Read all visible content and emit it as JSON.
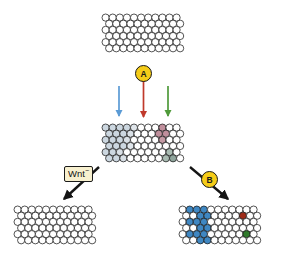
{
  "figure": {
    "background_color": "#ffffff"
  },
  "palette": {
    "cell_outline": "#1a1a1a",
    "cell_white": "#ffffff",
    "pale_blue": "#ccd7e0",
    "pale_blue_alt": "#d8e0e6",
    "pale_red": "#c89aa4",
    "pale_green": "#a9bbb2",
    "strong_blue": "#3f87c2",
    "dark_red": "#9e2b18",
    "dark_green": "#2f7a2b",
    "badge_yellow": "#f5cc18",
    "label_cream": "#f7f0cf",
    "arrow_blue": "#5b9bd5",
    "arrow_red": "#c0392b",
    "arrow_green": "#4f9a3a",
    "arrow_black": "#151515"
  },
  "nodes": {
    "a_badge": {
      "label": "A",
      "name": "signal-a"
    },
    "b_badge": {
      "label": "B",
      "name": "signal-b"
    }
  },
  "labels": {
    "wnt": {
      "text": "Wnt",
      "superscript": "−"
    }
  },
  "arrows": [
    {
      "name": "blue-down-arrow",
      "color": "#5b9bd5",
      "x1": 119,
      "y1": 86,
      "x2": 119,
      "y2": 116
    },
    {
      "name": "red-down-arrow",
      "color": "#c0392b",
      "x1": 143.5,
      "y1": 72,
      "x2": 143.5,
      "y2": 117
    },
    {
      "name": "green-down-arrow",
      "color": "#4f9a3a",
      "x1": 168,
      "y1": 86,
      "x2": 168,
      "y2": 116
    },
    {
      "name": "wnt-diagonal-arrow",
      "color": "#151515",
      "x1": 99,
      "y1": 167,
      "x2": 64,
      "y2": 199
    },
    {
      "name": "b-diagonal-arrow",
      "color": "#151515",
      "x1": 190,
      "y1": 167,
      "x2": 228,
      "y2": 199
    }
  ],
  "sheets": {
    "top": {
      "name": "undifferentiated-sheet",
      "x": 101,
      "y": 13,
      "cols": 11,
      "rows": 6,
      "radius": 3.6,
      "step": 7.1,
      "cells": []
    },
    "middle": {
      "name": "patterned-sheet",
      "x": 101,
      "y": 123,
      "cols": 11,
      "rows": 6,
      "radius": 3.6,
      "step": 7.1,
      "cells": [
        {
          "r": 0,
          "c": 0,
          "fill": "#ccd7e0"
        },
        {
          "r": 0,
          "c": 1,
          "fill": "#ccd7e0"
        },
        {
          "r": 0,
          "c": 2,
          "fill": "#ccd7e0"
        },
        {
          "r": 0,
          "c": 3,
          "fill": "#ccd7e0"
        },
        {
          "r": 0,
          "c": 4,
          "fill": "#dfe5ea"
        },
        {
          "r": 0,
          "c": 8,
          "fill": "#c08f9c"
        },
        {
          "r": 1,
          "c": 0,
          "fill": "#ccd7e0"
        },
        {
          "r": 1,
          "c": 1,
          "fill": "#ccd7e0"
        },
        {
          "r": 1,
          "c": 2,
          "fill": "#ccd7e0"
        },
        {
          "r": 1,
          "c": 3,
          "fill": "#d9e0e6"
        },
        {
          "r": 1,
          "c": 7,
          "fill": "#c08f9c"
        },
        {
          "r": 1,
          "c": 8,
          "fill": "#c08f9c"
        },
        {
          "r": 2,
          "c": 0,
          "fill": "#ccd7e0"
        },
        {
          "r": 2,
          "c": 1,
          "fill": "#ccd7e0"
        },
        {
          "r": 2,
          "c": 2,
          "fill": "#ccd7e0"
        },
        {
          "r": 2,
          "c": 3,
          "fill": "#d9e0e6"
        },
        {
          "r": 2,
          "c": 8,
          "fill": "#c49aa4"
        },
        {
          "r": 3,
          "c": 0,
          "fill": "#ccd7e0"
        },
        {
          "r": 3,
          "c": 1,
          "fill": "#ccd7e0"
        },
        {
          "r": 3,
          "c": 2,
          "fill": "#ccd7e0"
        },
        {
          "r": 3,
          "c": 3,
          "fill": "#dfe5ea"
        },
        {
          "r": 4,
          "c": 0,
          "fill": "#ccd7e0"
        },
        {
          "r": 4,
          "c": 1,
          "fill": "#ccd7e0"
        },
        {
          "r": 4,
          "c": 2,
          "fill": "#d9e0e6"
        },
        {
          "r": 4,
          "c": 9,
          "fill": "#a9bbb2"
        },
        {
          "r": 5,
          "c": 0,
          "fill": "#ccd7e0"
        },
        {
          "r": 5,
          "c": 1,
          "fill": "#ccd7e0"
        },
        {
          "r": 5,
          "c": 2,
          "fill": "#d9e0e6"
        },
        {
          "r": 5,
          "c": 8,
          "fill": "#a9bbb2"
        },
        {
          "r": 5,
          "c": 9,
          "fill": "#8fa59c"
        }
      ]
    },
    "bottom_left": {
      "name": "wnt-minus-sheet",
      "x": 13,
      "y": 205,
      "cols": 11,
      "rows": 6,
      "radius": 3.6,
      "step": 7.1,
      "cells": []
    },
    "bottom_right": {
      "name": "differentiated-sheet",
      "x": 178,
      "y": 205,
      "cols": 11,
      "rows": 6,
      "radius": 3.6,
      "step": 7.1,
      "cells": [
        {
          "r": 0,
          "c": 1,
          "fill": "#3f87c2"
        },
        {
          "r": 0,
          "c": 2,
          "fill": "#3f87c2"
        },
        {
          "r": 0,
          "c": 3,
          "fill": "#3f87c2"
        },
        {
          "r": 1,
          "c": 2,
          "fill": "#3f87c2"
        },
        {
          "r": 1,
          "c": 3,
          "fill": "#3f87c2"
        },
        {
          "r": 1,
          "c": 8,
          "fill": "#9e2b18"
        },
        {
          "r": 2,
          "c": 1,
          "fill": "#3f87c2"
        },
        {
          "r": 2,
          "c": 2,
          "fill": "#3f87c2"
        },
        {
          "r": 2,
          "c": 3,
          "fill": "#3f87c2"
        },
        {
          "r": 3,
          "c": 2,
          "fill": "#3f87c2"
        },
        {
          "r": 3,
          "c": 3,
          "fill": "#3f87c2"
        },
        {
          "r": 4,
          "c": 1,
          "fill": "#3f87c2"
        },
        {
          "r": 4,
          "c": 2,
          "fill": "#3f87c2"
        },
        {
          "r": 4,
          "c": 3,
          "fill": "#3f87c2"
        },
        {
          "r": 4,
          "c": 9,
          "fill": "#2f7a2b"
        },
        {
          "r": 5,
          "c": 2,
          "fill": "#3f87c2"
        },
        {
          "r": 5,
          "c": 3,
          "fill": "#3f87c2"
        }
      ]
    }
  }
}
